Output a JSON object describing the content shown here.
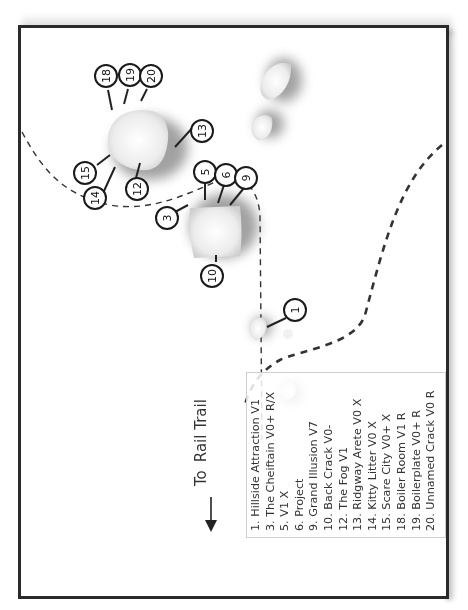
{
  "map": {
    "orientation": "rotated 90deg counter-clockwise",
    "direction_label": {
      "to": "To",
      "destination": "Rail Trail",
      "icon": "arrow-down-icon"
    },
    "legend": {
      "items": [
        "1. Hillside Attraction V1",
        "3. The Cheiftain V0+ R/X",
        "5. V1 X",
        "6. Project",
        "9. Grand Illusion V7",
        "10. Back Crack V0-",
        "12. The Fog V1",
        "13. Ridgway Arete V0 X",
        "14. Kitty Litter V0 X",
        "15. Scare City V0+ X",
        "18. Boiler Room V1 R",
        "19. Boilerplate V0+ R",
        "20. Unnamed Crack V0 R"
      ]
    },
    "markers": [
      {
        "label": "18"
      },
      {
        "label": "19"
      },
      {
        "label": "20"
      },
      {
        "label": "13"
      },
      {
        "label": "15"
      },
      {
        "label": "14"
      },
      {
        "label": "12"
      },
      {
        "label": "5"
      },
      {
        "label": "6"
      },
      {
        "label": "9"
      },
      {
        "label": "3"
      },
      {
        "label": "10"
      },
      {
        "label": "1"
      }
    ],
    "colors": {
      "frame": "#2a2a2a",
      "trail": "#333333",
      "boulder": "#e8e8e8",
      "legend_border": "#cfcfcf"
    }
  }
}
